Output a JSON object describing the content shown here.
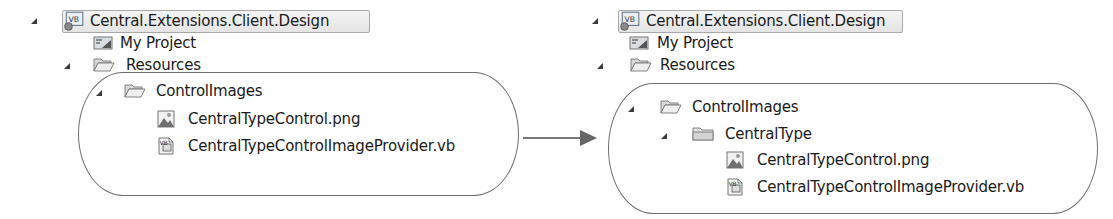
{
  "before": {
    "tree": [
      {
        "label": "Central.Extensions.Client.Design",
        "icon": "vb-project-icon",
        "expanded": true,
        "selected": true
      },
      {
        "label": "My Project",
        "icon": "my-project-icon"
      },
      {
        "label": "Resources",
        "icon": "folder-open-icon",
        "expanded": true
      },
      {
        "label": "ControlImages",
        "icon": "folder-open-icon",
        "expanded": true
      },
      {
        "label": "CentralTypeControl.png",
        "icon": "image-file-icon"
      },
      {
        "label": "CentralTypeControlImageProvider.vb",
        "icon": "vb-file-icon"
      }
    ]
  },
  "after": {
    "tree": [
      {
        "label": "Central.Extensions.Client.Design",
        "icon": "vb-project-icon",
        "expanded": true,
        "selected": true
      },
      {
        "label": "My Project",
        "icon": "my-project-icon"
      },
      {
        "label": "Resources",
        "icon": "folder-open-icon",
        "expanded": true
      },
      {
        "label": "ControlImages",
        "icon": "folder-open-icon",
        "expanded": true
      },
      {
        "label": "CentralType",
        "icon": "folder-closed-icon",
        "expanded": true
      },
      {
        "label": "CentralTypeControl.png",
        "icon": "image-file-icon"
      },
      {
        "label": "CentralTypeControlImageProvider.vb",
        "icon": "vb-file-icon"
      }
    ]
  },
  "arrow": {
    "direction": "right",
    "meaning": "transformation"
  },
  "colors": {
    "text": "#1a1a1a",
    "outline": "#6e6e6e",
    "selection_border": "#a9a9a9"
  }
}
